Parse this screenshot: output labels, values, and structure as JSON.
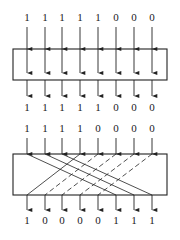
{
  "diagram": {
    "type": "shifter-diagram",
    "columns_x": [
      27,
      45,
      62,
      80,
      98,
      116,
      134,
      152
    ],
    "colors": {
      "stroke": "#222222",
      "text": "#1a1a1a",
      "background": "#ffffff"
    },
    "stage1": {
      "box": {
        "x": 13,
        "y": 49,
        "w": 154,
        "h": 31
      },
      "inputs": [
        "1",
        "1",
        "1",
        "1",
        "1",
        "0",
        "0",
        "0"
      ],
      "outputs": [
        "1",
        "1",
        "1",
        "1",
        "1",
        "0",
        "0",
        "0"
      ],
      "routing": "straight-through"
    },
    "stage2": {
      "box": {
        "x": 13,
        "y": 154,
        "w": 154,
        "h": 41
      },
      "inputs": [
        "1",
        "1",
        "1",
        "1",
        "0",
        "0",
        "0",
        "0"
      ],
      "outputs": [
        "1",
        "0",
        "0",
        "0",
        "0",
        "1",
        "1",
        "1"
      ],
      "routing": "rotate",
      "connections": [
        {
          "from": 0,
          "to": 5,
          "style": "solid"
        },
        {
          "from": 1,
          "to": 6,
          "style": "solid"
        },
        {
          "from": 2,
          "to": 7,
          "style": "solid"
        },
        {
          "from": 3,
          "to": 0,
          "style": "solid"
        },
        {
          "from": 4,
          "to": 1,
          "style": "dashed"
        },
        {
          "from": 5,
          "to": 2,
          "style": "dashed"
        },
        {
          "from": 6,
          "to": 3,
          "style": "dashed"
        },
        {
          "from": 7,
          "to": 4,
          "style": "dashed"
        }
      ]
    }
  }
}
